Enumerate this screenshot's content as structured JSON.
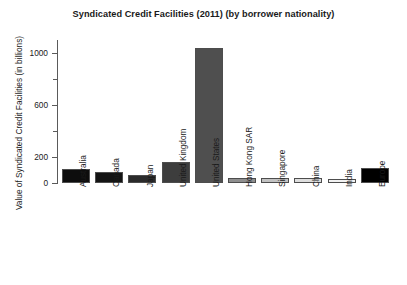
{
  "chart_data": {
    "type": "bar",
    "title": "Syndicated Credit Facilities (2011) (by borrower nationality)",
    "xlabel": "",
    "ylabel": "Value of Syndicated Credit Facilities (in billions)",
    "ylim": [
      0,
      1100
    ],
    "yticks": [
      0,
      200,
      600,
      1000
    ],
    "ytick_labels": [
      "0",
      "200",
      "600",
      "1000"
    ],
    "yticks_minor": [
      400,
      800
    ],
    "grid": false,
    "legend": null,
    "categories": [
      "Australia",
      "Canada",
      "Japan",
      "United Kingdom",
      "United States",
      "Hong Kong SAR",
      "Singapore",
      "China",
      "India",
      "Europe"
    ],
    "values": [
      110,
      85,
      65,
      165,
      1040,
      42,
      38,
      35,
      30,
      115
    ],
    "bar_colors": [
      "#0d0d0d",
      "#141414",
      "#2b2b2b",
      "#3d3d3d",
      "#4f4f4f",
      "#8f8f8f",
      "#c2c2c2",
      "#dedede",
      "#f2f2f2",
      "#000000"
    ],
    "bar_edge_color": "#4d4d4d",
    "background_color": "#ffffff",
    "axis_color": "#5a5a5a",
    "text_color": "#1a1a1a"
  }
}
